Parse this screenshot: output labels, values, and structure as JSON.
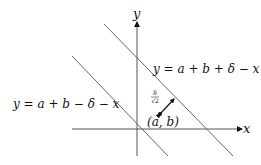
{
  "diagram": {
    "axes": {
      "x_label": "x",
      "y_label": "y"
    },
    "lines": [
      {
        "id": "upper",
        "label": "y = a + b + δ − x"
      },
      {
        "id": "lower",
        "label": "y = a + b − δ − x"
      }
    ],
    "point": {
      "label": "(a, b)"
    },
    "distance_annotation": {
      "numerator": "δ",
      "denominator": "√2"
    },
    "colors": {
      "stroke": "#555555",
      "ink": "#111111",
      "background": "#ffffff"
    }
  }
}
